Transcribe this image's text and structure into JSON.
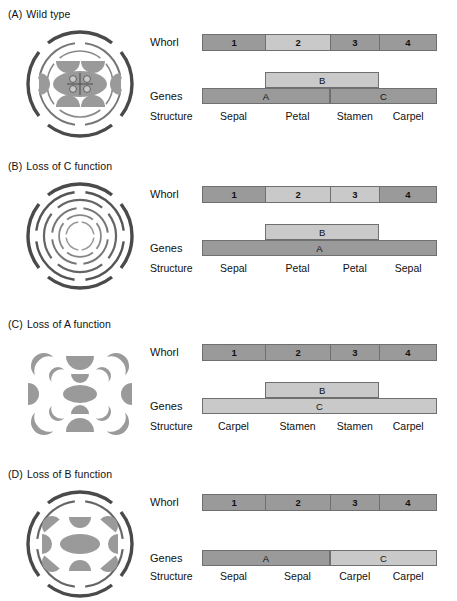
{
  "figure": {
    "row_labels": {
      "whorl": "Whorl",
      "genes": "Genes",
      "structure": "Structure"
    },
    "colors": {
      "dark": "#9a9a9a",
      "light": "#c9c9c9",
      "mid": "#b0b0b0",
      "stroke": "#6f6f6f"
    }
  },
  "panels": [
    {
      "tag": "(A)",
      "title": "Wild type",
      "flower": "wild-type-flower",
      "whorls": [
        {
          "label": "1",
          "shade": "dark"
        },
        {
          "label": "2",
          "shade": "light"
        },
        {
          "label": "3",
          "shade": "dark"
        },
        {
          "label": "4",
          "shade": "dark"
        }
      ],
      "gene_rows": [
        {
          "segments": [
            {
              "label": "B",
              "shade": "light",
              "start": 1,
              "span": 2
            }
          ]
        },
        {
          "segments": [
            {
              "label": "A",
              "shade": "dark",
              "start": 0,
              "span": 2
            },
            {
              "label": "C",
              "shade": "dark",
              "start": 2,
              "span": 2
            }
          ]
        }
      ],
      "structures": [
        "Sepal",
        "Petal",
        "Stamen",
        "Carpel"
      ]
    },
    {
      "tag": "(B)",
      "title": "Loss of C function",
      "flower": "loss-of-c-flower",
      "whorls": [
        {
          "label": "1",
          "shade": "dark"
        },
        {
          "label": "2",
          "shade": "light"
        },
        {
          "label": "3",
          "shade": "light"
        },
        {
          "label": "4",
          "shade": "dark"
        }
      ],
      "gene_rows": [
        {
          "segments": [
            {
              "label": "B",
              "shade": "light",
              "start": 1,
              "span": 2
            }
          ]
        },
        {
          "segments": [
            {
              "label": "A",
              "shade": "dark",
              "start": 0,
              "span": 4
            }
          ]
        }
      ],
      "structures": [
        "Sepal",
        "Petal",
        "Petal",
        "Sepal"
      ]
    },
    {
      "tag": "(C)",
      "title": "Loss of A function",
      "flower": "loss-of-a-flower",
      "whorls": [
        {
          "label": "1",
          "shade": "dark"
        },
        {
          "label": "2",
          "shade": "dark"
        },
        {
          "label": "3",
          "shade": "dark"
        },
        {
          "label": "4",
          "shade": "dark"
        }
      ],
      "gene_rows": [
        {
          "segments": [
            {
              "label": "B",
              "shade": "light",
              "start": 1,
              "span": 2
            }
          ]
        },
        {
          "segments": [
            {
              "label": "C",
              "shade": "light",
              "start": 0,
              "span": 4
            }
          ]
        }
      ],
      "structures": [
        "Carpel",
        "Stamen",
        "Stamen",
        "Carpel"
      ]
    },
    {
      "tag": "(D)",
      "title": "Loss of B function",
      "flower": "loss-of-b-flower",
      "whorls": [
        {
          "label": "1",
          "shade": "dark"
        },
        {
          "label": "2",
          "shade": "dark"
        },
        {
          "label": "3",
          "shade": "dark"
        },
        {
          "label": "4",
          "shade": "dark"
        }
      ],
      "gene_rows": [
        {
          "segments": [
            {
              "label": "A",
              "shade": "dark",
              "start": 0,
              "span": 2
            },
            {
              "label": "C",
              "shade": "light",
              "start": 2,
              "span": 2
            }
          ]
        }
      ],
      "structures": [
        "Sepal",
        "Sepal",
        "Carpel",
        "Carpel"
      ]
    }
  ]
}
